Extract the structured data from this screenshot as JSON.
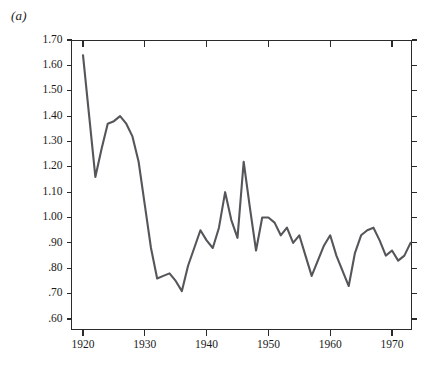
{
  "figure": {
    "panel_label": "(a)",
    "line_color": "#55565a",
    "axis_color": "#2b2b2b",
    "background": "#ffffff"
  },
  "chart_data": {
    "type": "line",
    "title": "",
    "subtitle": "",
    "xlabel": "",
    "ylabel": "",
    "grid": false,
    "legend": null,
    "xlim": [
      1919,
      1974
    ],
    "ylim": [
      0.555,
      1.7
    ],
    "xticks": [
      1920,
      1930,
      1940,
      1950,
      1960,
      1970
    ],
    "xtick_labels": [
      "1920",
      "1930",
      "1940",
      "1950",
      "1960",
      "1970"
    ],
    "yticks": [
      1.7,
      1.6,
      1.5,
      1.4,
      1.3,
      1.2,
      1.1,
      1.0,
      0.9,
      0.8,
      0.7,
      0.6
    ],
    "ytick_labels": [
      "1.70",
      "1.60",
      "1.50",
      "1.40",
      "1.30",
      "1.20",
      "1.10",
      "1.00",
      ".90",
      ".80",
      ".70",
      ".60"
    ],
    "x": [
      1920,
      1921,
      1922,
      1923,
      1924,
      1925,
      1926,
      1927,
      1928,
      1929,
      1930,
      1931,
      1932,
      1933,
      1934,
      1935,
      1936,
      1937,
      1938,
      1939,
      1940,
      1941,
      1942,
      1943,
      1944,
      1945,
      1946,
      1947,
      1948,
      1949,
      1950,
      1951,
      1952,
      1953,
      1954,
      1955,
      1956,
      1957,
      1958,
      1959,
      1960,
      1961,
      1962,
      1963,
      1964,
      1965,
      1966,
      1967,
      1968,
      1969,
      1970,
      1971,
      1972,
      1973
    ],
    "y": [
      1.64,
      1.4,
      1.16,
      1.27,
      1.37,
      1.38,
      1.4,
      1.37,
      1.32,
      1.22,
      1.05,
      0.88,
      0.76,
      0.77,
      0.78,
      0.75,
      0.71,
      0.81,
      0.88,
      0.95,
      0.91,
      0.88,
      0.96,
      1.1,
      0.99,
      0.92,
      1.22,
      1.04,
      0.87,
      1.0,
      1.0,
      0.98,
      0.93,
      0.96,
      0.9,
      0.93,
      0.85,
      0.77,
      0.83,
      0.89,
      0.93,
      0.85,
      0.79,
      0.73,
      0.86,
      0.93,
      0.95,
      0.96,
      0.91,
      0.85,
      0.87,
      0.83,
      0.85,
      0.9
    ]
  }
}
